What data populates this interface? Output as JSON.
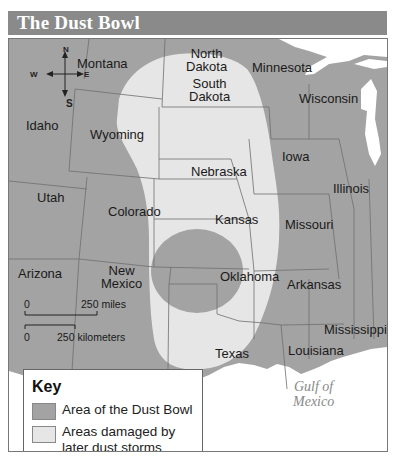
{
  "title": "The Dust Bowl",
  "colors": {
    "title_bar": "#8a8a8a",
    "title_text": "#ffffff",
    "dust_bowl_area": "#a3a3a3",
    "later_damage_area": "#e6e6e6",
    "other_land": "#a3a3a3",
    "water": "#ffffff",
    "key_background": "#ffffff"
  },
  "compass": {
    "north": "N",
    "south": "S",
    "east": "E",
    "west": "W"
  },
  "states": [
    {
      "name": "Montana",
      "lines": [
        "Montana"
      ]
    },
    {
      "name": "North Dakota",
      "lines": [
        "North",
        "Dakota"
      ]
    },
    {
      "name": "Minnesota",
      "lines": [
        "Minnesota"
      ]
    },
    {
      "name": "Wisconsin",
      "lines": [
        "Wisconsin"
      ]
    },
    {
      "name": "Idaho",
      "lines": [
        "Idaho"
      ]
    },
    {
      "name": "South Dakota",
      "lines": [
        "South",
        "Dakota"
      ]
    },
    {
      "name": "Wyoming",
      "lines": [
        "Wyoming"
      ]
    },
    {
      "name": "Iowa",
      "lines": [
        "Iowa"
      ]
    },
    {
      "name": "Nebraska",
      "lines": [
        "Nebraska"
      ]
    },
    {
      "name": "Illinois",
      "lines": [
        "Illinois"
      ]
    },
    {
      "name": "Utah",
      "lines": [
        "Utah"
      ]
    },
    {
      "name": "Colorado",
      "lines": [
        "Colorado"
      ]
    },
    {
      "name": "Kansas",
      "lines": [
        "Kansas"
      ]
    },
    {
      "name": "Missouri",
      "lines": [
        "Missouri"
      ]
    },
    {
      "name": "Arizona",
      "lines": [
        "Arizona"
      ]
    },
    {
      "name": "New Mexico",
      "lines": [
        "New",
        "Mexico"
      ]
    },
    {
      "name": "Oklahoma",
      "lines": [
        "Oklahoma"
      ]
    },
    {
      "name": "Arkansas",
      "lines": [
        "Arkansas"
      ]
    },
    {
      "name": "Mississippi",
      "lines": [
        "Mississippi"
      ]
    },
    {
      "name": "Texas",
      "lines": [
        "Texas"
      ]
    },
    {
      "name": "Louisiana",
      "lines": [
        "Louisiana"
      ]
    }
  ],
  "water_labels": {
    "gulf_line1": "Gulf of",
    "gulf_line2": "Mexico"
  },
  "scale": {
    "miles_zero": "0",
    "miles_label": "250 miles",
    "km_zero": "0",
    "km_label": "250 kilometers"
  },
  "key": {
    "title": "Key",
    "items": [
      {
        "label": "Area of the Dust Bowl",
        "color": "#a3a3a3"
      },
      {
        "label_line1": "Areas damaged by",
        "label_line2": "later dust storms",
        "color": "#e6e6e6"
      }
    ]
  }
}
